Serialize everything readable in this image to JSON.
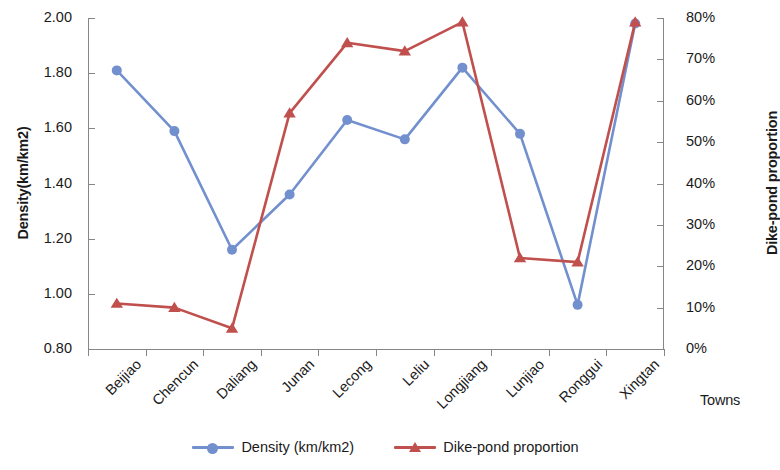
{
  "chart_data": {
    "type": "line",
    "title": "",
    "xlabel": "Towns",
    "categories": [
      "Beijiao",
      "Chencun",
      "Daliang",
      "Junan",
      "Lecong",
      "Leliu",
      "Longjiang",
      "Lunjiao",
      "Ronggui",
      "Xingtan"
    ],
    "axes": {
      "y_left": {
        "label": "Density(km/km2)",
        "ticks": [
          "0.80",
          "1.00",
          "1.20",
          "1.40",
          "1.60",
          "1.80",
          "2.00"
        ],
        "min": 0.8,
        "max": 2.0,
        "step": 0.2
      },
      "y_right": {
        "label": "Dike-pond proportion",
        "ticks": [
          "0%",
          "10%",
          "20%",
          "30%",
          "40%",
          "50%",
          "60%",
          "70%",
          "80%"
        ],
        "min": 0,
        "max": 80,
        "step": 10
      },
      "grid": false
    },
    "series": [
      {
        "name": "Density (km/km2)",
        "axis": "y_left",
        "color": "#7390CE",
        "marker": "circle",
        "values": [
          1.81,
          1.59,
          1.16,
          1.36,
          1.63,
          1.56,
          1.82,
          1.58,
          0.96,
          1.98
        ]
      },
      {
        "name": "Dike-pond proportion",
        "axis": "y_right",
        "color": "#C0504D",
        "marker": "triangle",
        "values": [
          11.0,
          10.0,
          5.0,
          57.0,
          74.0,
          72.0,
          79.0,
          22.0,
          21.0,
          79.0
        ]
      }
    ],
    "legend": {
      "position": "bottom",
      "entries": [
        "Density (km/km2)",
        "Dike-pond proportion"
      ]
    }
  }
}
